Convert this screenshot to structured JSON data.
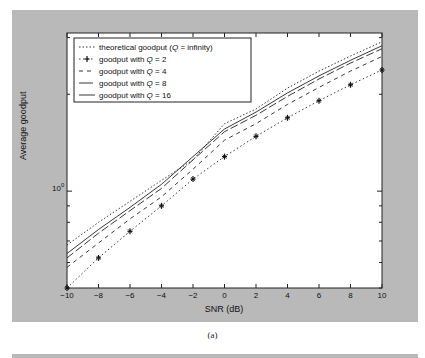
{
  "chart_data": {
    "type": "line",
    "title": "",
    "xlabel": "SNR (dB)",
    "ylabel": "Average goodput",
    "yscale": "log",
    "xlim": [
      -10,
      10
    ],
    "ylim": [
      0.5,
      3.1
    ],
    "x": [
      -10,
      -8,
      -6,
      -4,
      -2,
      0,
      2,
      4,
      6,
      8,
      10
    ],
    "xticks": [
      "−10",
      "−8",
      "−6",
      "−4",
      "−2",
      "0",
      "2",
      "4",
      "6",
      "8",
      "10"
    ],
    "yticks": [
      "10⁰"
    ],
    "grid": false,
    "legend_position": "upper left",
    "series": [
      {
        "name": "theoretical goodput (Q = infinity)",
        "style": "dotted",
        "values": [
          0.68,
          0.8,
          0.93,
          1.08,
          1.25,
          1.62,
          1.8,
          2.09,
          2.36,
          2.63,
          2.91
        ]
      },
      {
        "name": "goodput with Q = 2",
        "style": "dash-dot-star",
        "values": [
          0.5,
          0.62,
          0.75,
          0.9,
          1.09,
          1.28,
          1.48,
          1.69,
          1.91,
          2.14,
          2.38
        ]
      },
      {
        "name": "goodput with Q = 4",
        "style": "dashed",
        "values": [
          0.58,
          0.69,
          0.82,
          0.96,
          1.17,
          1.44,
          1.62,
          1.86,
          2.1,
          2.36,
          2.62
        ]
      },
      {
        "name": "goodput with Q = 8",
        "style": "long-dash",
        "values": [
          0.62,
          0.74,
          0.87,
          1.02,
          1.25,
          1.53,
          1.72,
          1.97,
          2.23,
          2.5,
          2.77
        ]
      },
      {
        "name": "goodput with Q = 16",
        "style": "solid",
        "values": [
          0.64,
          0.76,
          0.89,
          1.05,
          1.28,
          1.56,
          1.76,
          2.02,
          2.28,
          2.55,
          2.83
        ]
      }
    ],
    "caption": "(a)"
  },
  "legend": {
    "items": [
      {
        "prefix": "theoretical goodput (",
        "q": "Q",
        "suffix": " = infinity)"
      },
      {
        "prefix": "goodput with ",
        "q": "Q",
        "suffix": " = 2"
      },
      {
        "prefix": "goodput with ",
        "q": "Q",
        "suffix": " = 4"
      },
      {
        "prefix": "goodput with ",
        "q": "Q",
        "suffix": " = 8"
      },
      {
        "prefix": "goodput with ",
        "q": "Q",
        "suffix": " = 16"
      }
    ]
  },
  "colors": {
    "panel": "#b9b9b9",
    "plot_bg": "#ffffff",
    "line": "#222222"
  }
}
